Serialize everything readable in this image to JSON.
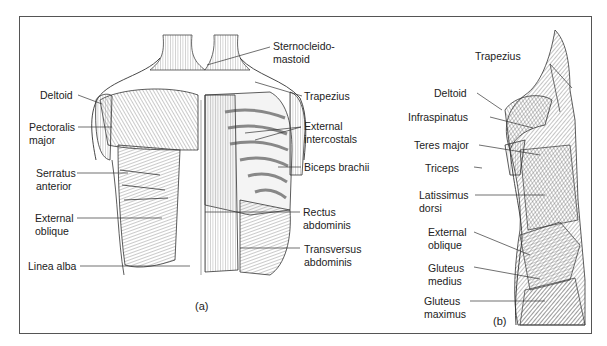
{
  "figure": {
    "panel_a": {
      "caption": "(a)",
      "view": "anterior torso",
      "labels": [
        {
          "id": "deltoid",
          "line1": "Deltoid",
          "line2": ""
        },
        {
          "id": "pectoralis-major",
          "line1": "Pectoralis",
          "line2": "major"
        },
        {
          "id": "serratus-anterior",
          "line1": "Serratus",
          "line2": "anterior"
        },
        {
          "id": "external-oblique",
          "line1": "External",
          "line2": "oblique"
        },
        {
          "id": "linea-alba",
          "line1": "Linea alba",
          "line2": ""
        },
        {
          "id": "sternocleidomastoid",
          "line1": "Sternocleido-",
          "line2": "mastoid"
        },
        {
          "id": "trapezius",
          "line1": "Trapezius",
          "line2": ""
        },
        {
          "id": "external-intercostals",
          "line1": "External",
          "line2": "intercostals"
        },
        {
          "id": "biceps-brachii",
          "line1": "Biceps brachii",
          "line2": ""
        },
        {
          "id": "rectus-abdominis",
          "line1": "Rectus",
          "line2": "abdominis"
        },
        {
          "id": "transversus-abdominis",
          "line1": "Transversus",
          "line2": "abdominis"
        }
      ]
    },
    "panel_b": {
      "caption": "(b)",
      "view": "posterior lateral torso",
      "labels": [
        {
          "id": "trapezius",
          "line1": "Trapezius",
          "line2": ""
        },
        {
          "id": "deltoid",
          "line1": "Deltoid",
          "line2": ""
        },
        {
          "id": "infraspinatus",
          "line1": "Infraspinatus",
          "line2": ""
        },
        {
          "id": "teres-major",
          "line1": "Teres major",
          "line2": ""
        },
        {
          "id": "triceps",
          "line1": "Triceps",
          "line2": ""
        },
        {
          "id": "latissimus-dorsi",
          "line1": "Latissimus",
          "line2": "dorsi"
        },
        {
          "id": "external-oblique",
          "line1": "External",
          "line2": "oblique"
        },
        {
          "id": "gluteus-medius",
          "line1": "Gluteus",
          "line2": "medius"
        },
        {
          "id": "gluteus-maximus",
          "line1": "Gluteus",
          "line2": "maximus"
        }
      ]
    }
  }
}
